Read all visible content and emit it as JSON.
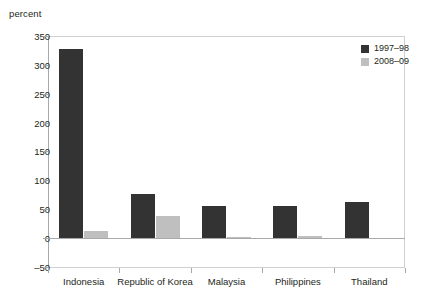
{
  "chart_data": {
    "type": "bar",
    "title": "",
    "subtitle": "",
    "xlabel": "",
    "ylabel": "percent",
    "unit_label": "percent",
    "categories": [
      "Indonesia",
      "Republic of Korea",
      "Malaysia",
      "Philippines",
      "Thailand"
    ],
    "series": [
      {
        "name": "1997–98",
        "color": "#333333",
        "values": [
          328,
          76,
          56,
          56,
          63
        ]
      },
      {
        "name": "2008–09",
        "color": "#bfbfbf",
        "values": [
          13,
          38,
          2,
          3,
          0
        ]
      }
    ],
    "ylim": [
      -50,
      350
    ],
    "yticks": [
      350,
      300,
      250,
      200,
      150,
      100,
      50,
      0,
      -50
    ],
    "ytick_labels": [
      "350",
      "300",
      "250",
      "200",
      "150",
      "100",
      "50",
      "0",
      "–50"
    ],
    "grid": false,
    "legend_position": "top-right"
  },
  "legend": {
    "entries": [
      {
        "label": "1997–98"
      },
      {
        "label": "2008–09"
      }
    ]
  }
}
